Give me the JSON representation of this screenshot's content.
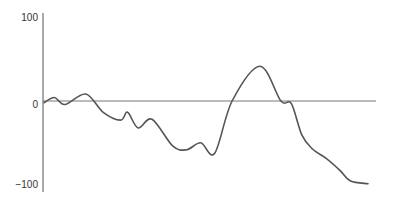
{
  "chart_data": {
    "type": "line",
    "title": "",
    "xlabel": "",
    "ylabel": "",
    "ylim": [
      -100,
      100
    ],
    "yticks": [
      100,
      0,
      -100
    ],
    "ytick_labels": [
      "100",
      "0",
      "−100"
    ],
    "grid": false,
    "legend": null,
    "zero_line": true,
    "x": [
      0,
      3,
      6,
      12,
      17,
      22,
      24,
      27,
      31,
      37,
      41,
      45,
      49,
      54,
      62,
      68,
      71,
      74,
      77,
      81,
      85,
      88,
      93
    ],
    "series": [
      {
        "name": "series-1",
        "values": [
          -2,
          4,
          -4,
          8,
          -13,
          -22,
          -13,
          -31,
          -21,
          -52,
          -56,
          -48,
          -60,
          0,
          40,
          0,
          -3,
          -39,
          -55,
          -66,
          -80,
          -92,
          -95
        ],
        "color": "#555555"
      }
    ]
  },
  "axis": {
    "labels": {
      "top": "100",
      "middle": "0",
      "bottom": "−100"
    }
  }
}
